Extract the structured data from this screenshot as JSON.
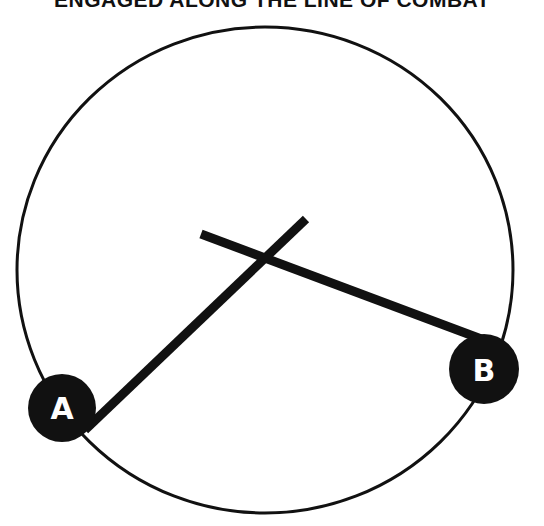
{
  "title": "ENGAGED ALONG THE LINE OF COMBAT",
  "diagram": {
    "circle": {
      "cx": 265,
      "cy": 270,
      "rx": 248,
      "ry": 243,
      "stroke": "#111111"
    },
    "lines": [
      {
        "name": "line-a",
        "x1": 85,
        "y1": 430,
        "x2": 306,
        "y2": 219
      },
      {
        "name": "line-b",
        "x1": 201,
        "y1": 234,
        "x2": 484,
        "y2": 340
      }
    ],
    "markers": [
      {
        "label": "A",
        "cx": 62,
        "cy": 408
      },
      {
        "label": "B",
        "cx": 484,
        "cy": 369
      }
    ],
    "ink_color": "#111111"
  }
}
